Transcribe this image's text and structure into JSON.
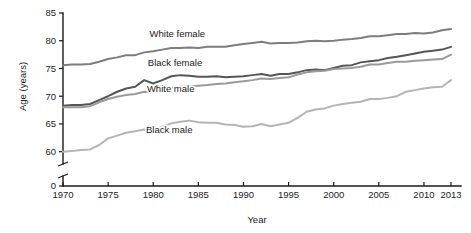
{
  "chart_data": {
    "type": "line",
    "title": "",
    "xlabel": "Year",
    "ylabel": "Age (years)",
    "xlim": [
      1970,
      2013
    ],
    "ylim": [
      58.5,
      85
    ],
    "grid": false,
    "legend_position": "inline-labels",
    "axis_break": {
      "present": true,
      "between": [
        0,
        58.5
      ],
      "zero_label": "0"
    },
    "xticks": [
      1970,
      1975,
      1980,
      1985,
      1990,
      1995,
      2000,
      2005,
      2010,
      2013
    ],
    "xtick_labels": [
      "1970",
      "1975",
      "1980",
      "1985",
      "1990",
      "1995",
      "2000",
      "2005",
      "2010",
      "2013"
    ],
    "yticks": [
      60,
      65,
      70,
      75,
      80,
      85
    ],
    "ytick_labels": [
      "60",
      "65",
      "70",
      "75",
      "80",
      "85"
    ],
    "x": [
      1970,
      1971,
      1972,
      1973,
      1974,
      1975,
      1976,
      1977,
      1978,
      1979,
      1980,
      1981,
      1982,
      1983,
      1984,
      1985,
      1986,
      1987,
      1988,
      1989,
      1990,
      1991,
      1992,
      1993,
      1994,
      1995,
      1996,
      1997,
      1998,
      1999,
      2000,
      2001,
      2002,
      2003,
      2004,
      2005,
      2006,
      2007,
      2008,
      2009,
      2010,
      2011,
      2012,
      2013
    ],
    "series": [
      {
        "name": "White female",
        "color": "#7d7d7d",
        "label_x": 1979.6,
        "label_y": 80.6,
        "values": [
          75.6,
          75.7,
          75.7,
          75.8,
          76.2,
          76.7,
          77.0,
          77.4,
          77.4,
          77.9,
          78.1,
          78.4,
          78.7,
          78.7,
          78.8,
          78.7,
          78.9,
          78.9,
          78.9,
          79.2,
          79.4,
          79.6,
          79.8,
          79.5,
          79.6,
          79.6,
          79.7,
          79.9,
          80.0,
          79.9,
          80.0,
          80.2,
          80.3,
          80.5,
          80.8,
          80.8,
          81.0,
          81.2,
          81.2,
          81.4,
          81.3,
          81.5,
          81.9,
          82.1
        ]
      },
      {
        "name": "Black female",
        "color": "#565656",
        "label_x": 1979.4,
        "label_y": 75.5,
        "values": [
          68.3,
          68.4,
          68.4,
          68.6,
          69.3,
          70.0,
          70.8,
          71.4,
          71.7,
          72.9,
          72.3,
          72.9,
          73.6,
          73.8,
          73.7,
          73.5,
          73.5,
          73.6,
          73.4,
          73.5,
          73.6,
          73.8,
          74.0,
          73.7,
          74.0,
          74.0,
          74.3,
          74.7,
          74.8,
          74.7,
          75.1,
          75.5,
          75.6,
          76.1,
          76.3,
          76.5,
          76.9,
          77.1,
          77.4,
          77.7,
          78.0,
          78.2,
          78.4,
          78.9
        ]
      },
      {
        "name": "White male",
        "color": "#9a9a9a",
        "label_x": 1979.3,
        "label_y": 70.7,
        "values": [
          68.0,
          68.0,
          68.0,
          68.2,
          68.9,
          69.5,
          69.9,
          70.2,
          70.4,
          70.8,
          70.7,
          71.1,
          71.5,
          71.7,
          71.8,
          71.9,
          72.0,
          72.2,
          72.3,
          72.5,
          72.7,
          72.9,
          73.2,
          73.1,
          73.3,
          73.4,
          73.9,
          74.3,
          74.5,
          74.6,
          74.9,
          75.0,
          75.1,
          75.3,
          75.7,
          75.7,
          76.0,
          76.2,
          76.2,
          76.4,
          76.5,
          76.6,
          76.7,
          77.5
        ]
      },
      {
        "name": "Black male",
        "color": "#b5b5b5",
        "label_x": 1979.2,
        "label_y": 63.3,
        "values": [
          60.0,
          60.1,
          60.3,
          60.4,
          61.2,
          62.4,
          62.9,
          63.4,
          63.7,
          64.0,
          63.8,
          64.5,
          65.1,
          65.4,
          65.6,
          65.3,
          65.2,
          65.2,
          64.9,
          64.8,
          64.5,
          64.6,
          65.0,
          64.6,
          64.9,
          65.2,
          66.1,
          67.2,
          67.6,
          67.8,
          68.3,
          68.6,
          68.8,
          69.0,
          69.5,
          69.5,
          69.7,
          70.0,
          70.8,
          71.1,
          71.4,
          71.6,
          71.7,
          72.9
        ]
      }
    ]
  }
}
